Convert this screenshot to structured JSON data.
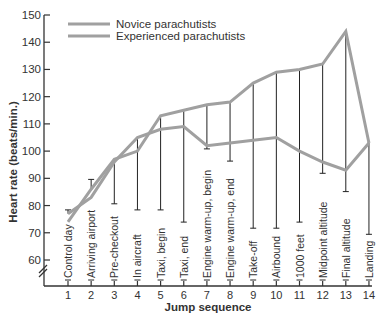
{
  "chart_data": {
    "type": "line",
    "title": "",
    "xlabel": "Jump sequence",
    "ylabel": "Heart rate (beats/min.)",
    "ylim": [
      60,
      150
    ],
    "yticks": [
      60,
      70,
      80,
      90,
      100,
      110,
      120,
      130,
      140,
      150
    ],
    "x": [
      1,
      2,
      3,
      4,
      5,
      6,
      7,
      8,
      9,
      10,
      11,
      12,
      13,
      14
    ],
    "categories": [
      "Control day",
      "Arriving airport",
      "Pre-checkout",
      "In aircraft",
      "Taxi, begin",
      "Taxi, end",
      "Engine warm-up, begin",
      "Engine warm-up, end",
      "Take-off",
      "Airbound",
      "1000 feet",
      "Midpoint altitude",
      "Final altitude",
      "Landing"
    ],
    "series": [
      {
        "name": "Novice parachutists",
        "values": [
          74,
          86,
          97,
          100,
          113,
          115,
          117,
          118,
          125,
          129,
          130,
          132,
          144,
          103
        ]
      },
      {
        "name": "Experienced parachutists",
        "values": [
          77,
          83,
          96,
          105,
          108,
          109,
          102,
          103,
          104,
          105,
          100,
          96,
          93,
          103
        ]
      }
    ],
    "legend_position": "top-left",
    "grid": false,
    "axis_break": true
  },
  "colors": {
    "line": "#a0a0a0",
    "axis": "#333333",
    "category_marker": "#222222"
  }
}
